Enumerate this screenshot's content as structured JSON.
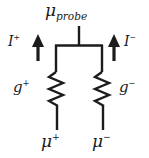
{
  "figure": {
    "background_color": "#ffffff",
    "line_color": "#1c1c1c",
    "width": 149,
    "height": 158
  },
  "labels": {
    "probe": {
      "base": "μ",
      "subscript": "probe",
      "name": "mu-probe"
    },
    "current_left": {
      "base": "I",
      "superscript": "+",
      "name": "I-plus"
    },
    "current_right": {
      "base": "I",
      "superscript": "−",
      "name": "I-minus"
    },
    "conductance_left": {
      "base": "g",
      "superscript": "+",
      "name": "g-plus"
    },
    "conductance_right": {
      "base": "g",
      "superscript": "−",
      "name": "g-minus"
    },
    "potential_left": {
      "base": "μ",
      "superscript": "+",
      "name": "mu-plus"
    },
    "potential_right": {
      "base": "μ",
      "superscript": "−",
      "name": "mu-minus"
    }
  },
  "arrows": {
    "left": {
      "direction": "up",
      "name": "current-arrow-left"
    },
    "right": {
      "direction": "up",
      "name": "current-arrow-right"
    }
  },
  "elements": {
    "resistor_left": {
      "type": "zigzag-resistor",
      "zigzag_peaks": 5
    },
    "resistor_right": {
      "type": "zigzag-resistor",
      "zigzag_peaks": 5
    },
    "probe_stub": {
      "type": "wire"
    },
    "top_bus": {
      "type": "wire"
    }
  }
}
